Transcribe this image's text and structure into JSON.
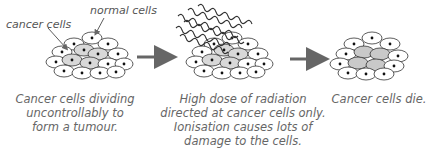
{
  "labels": {
    "cancer_cells": "cancer cells",
    "normal_cells": "normal cells"
  },
  "stages": [
    {
      "caption_lines": [
        "Cancer cells dividing",
        "uncontrollably to",
        "form a tumour."
      ]
    },
    {
      "caption_lines": [
        "High dose of radiation",
        "directed at cancer cells only.",
        "Ionisation causes lots of",
        "damage to the cells."
      ]
    },
    {
      "caption_lines": [
        "Cancer cells die."
      ]
    }
  ],
  "colors": {
    "cell_outline": "#333333",
    "normal_cell_fill": "#ffffff",
    "cancer_cell_fill": "#d8d8d8",
    "dead_cell_fill": "#c9c9c9",
    "arrow": "#666666",
    "radiation_wave": "#333333"
  }
}
